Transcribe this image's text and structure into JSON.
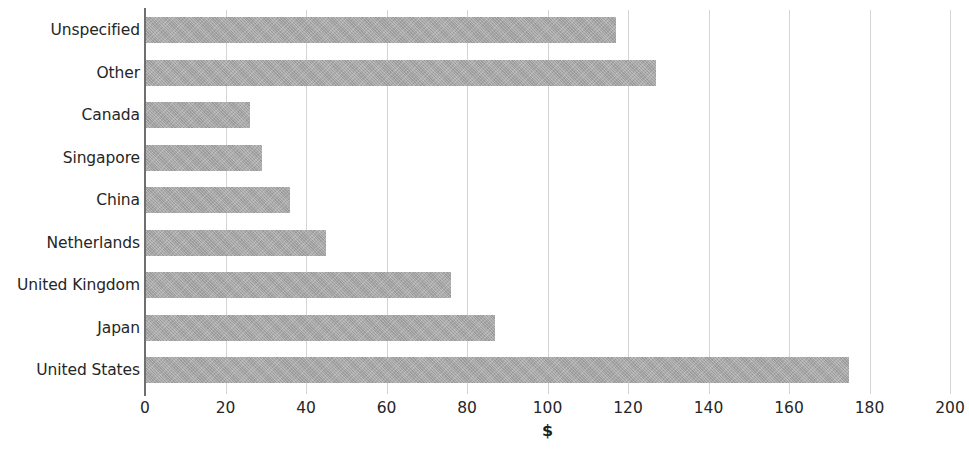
{
  "chart_data": {
    "type": "bar",
    "orientation": "horizontal",
    "title": "",
    "subtitle": "",
    "xlabel": "$",
    "ylabel": "",
    "xlim": [
      0,
      200
    ],
    "xticks": [
      0,
      20,
      40,
      60,
      80,
      100,
      120,
      140,
      160,
      180,
      200
    ],
    "xtick_labels": [
      "0",
      "20",
      "40",
      "60",
      "80",
      "100",
      "120",
      "140",
      "160",
      "180",
      "200"
    ],
    "grid": "vertical",
    "legend": "none",
    "bar_color": "#a9a9a9",
    "axis_color": "#6f6f6f",
    "gridline_color": "#d4d4d4",
    "categories": [
      "Unspecified",
      "Other",
      "Canada",
      "Singapore",
      "China",
      "Netherlands",
      "United Kingdom",
      "Japan",
      "United States"
    ],
    "values": [
      117,
      127,
      26,
      29,
      36,
      45,
      76,
      87,
      175
    ],
    "series": [
      {
        "name": "",
        "values": [
          117,
          127,
          26,
          29,
          36,
          45,
          76,
          87,
          175
        ]
      }
    ]
  }
}
